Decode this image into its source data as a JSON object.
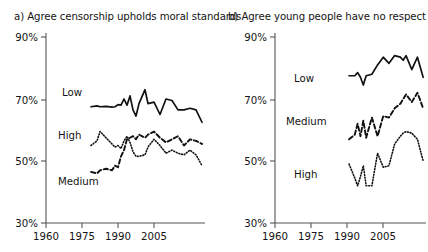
{
  "figure": {
    "background": "#ffffff",
    "ink_color": "#111111",
    "axis_color": "#555555"
  },
  "panels": [
    {
      "key": "panel_a",
      "label": "a)",
      "title": "a) Agree censorship upholds moral standards"
    },
    {
      "key": "panel_b",
      "label": "b)",
      "title": "b) Agree young people have no respect"
    }
  ],
  "chart_data": [
    {
      "type": "line",
      "title": "a) Agree censorship upholds moral standards",
      "xlabel": "",
      "ylabel": "",
      "xlim": [
        1960,
        2013
      ],
      "ylim": [
        30,
        90
      ],
      "xticks": [
        1960,
        1975,
        1990,
        2005
      ],
      "xtick_labels": [
        "1960",
        "1975",
        "1990",
        "2005"
      ],
      "yticks": [
        30,
        50,
        70,
        90
      ],
      "ytick_labels": [
        "30%",
        "50%",
        "70%",
        "90%"
      ],
      "grid": false,
      "legend": "inline-labels",
      "annotations": [
        {
          "text": "Low",
          "x": 1977,
          "y": 71.5
        },
        {
          "text": "High",
          "x": 1976,
          "y": 57.5
        },
        {
          "text": "Medium",
          "x": 1977,
          "y": 44.5
        }
      ],
      "series": [
        {
          "name": "Low",
          "style": "solid",
          "x": [
            1975,
            1977,
            1978,
            1980,
            1982,
            1983,
            1984,
            1985,
            1986,
            1987,
            1988,
            1989,
            1990,
            1991,
            1993,
            1994,
            1996,
            1998,
            2000,
            2002,
            2004,
            2006,
            2008,
            2010,
            2012
          ],
          "values": [
            67.5,
            67.8,
            67.5,
            67.6,
            67.4,
            67.5,
            68.2,
            68.0,
            70.0,
            68.0,
            71.0,
            66.5,
            64.5,
            68.5,
            73.0,
            68.5,
            69.0,
            65.0,
            70.0,
            69.5,
            66.5,
            66.5,
            67.0,
            66.5,
            62.5
          ]
        },
        {
          "name": "Medium",
          "style": "dashed",
          "x": [
            1975,
            1977,
            1978,
            1980,
            1982,
            1983,
            1984,
            1985,
            1986,
            1987,
            1988,
            1989,
            1990,
            1991,
            1993,
            1994,
            1996,
            1998,
            2000,
            2002,
            2004,
            2006,
            2008,
            2010,
            2012
          ],
          "values": [
            46.5,
            46.0,
            47.0,
            47.5,
            47.0,
            48.5,
            48.0,
            51.5,
            53.5,
            57.0,
            57.5,
            58.0,
            57.0,
            58.5,
            57.5,
            58.5,
            59.5,
            57.5,
            56.0,
            57.0,
            58.0,
            55.0,
            57.0,
            56.5,
            55.5
          ]
        },
        {
          "name": "High",
          "style": "dotted",
          "x": [
            1975,
            1977,
            1978,
            1980,
            1982,
            1983,
            1984,
            1985,
            1986,
            1987,
            1988,
            1989,
            1990,
            1991,
            1993,
            1994,
            1996,
            1998,
            2000,
            2002,
            2004,
            2006,
            2008,
            2010,
            2012
          ],
          "values": [
            55.0,
            56.5,
            59.5,
            57.5,
            55.5,
            54.5,
            55.0,
            54.0,
            56.5,
            58.0,
            56.0,
            53.0,
            51.5,
            51.5,
            52.0,
            54.5,
            57.0,
            55.0,
            52.5,
            53.5,
            52.5,
            52.0,
            53.5,
            52.0,
            48.5
          ]
        }
      ]
    },
    {
      "type": "line",
      "title": "b) Agree young people have no respect",
      "xlabel": "",
      "ylabel": "",
      "xlim": [
        1960,
        2013
      ],
      "ylim": [
        30,
        90
      ],
      "xticks": [
        1960,
        1975,
        1990,
        2005
      ],
      "xtick_labels": [
        "1960",
        "1975",
        "1990",
        "2005"
      ],
      "yticks": [
        30,
        50,
        70,
        90
      ],
      "ytick_labels": [
        "30%",
        "50%",
        "70%",
        "90%"
      ],
      "grid": false,
      "legend": "inline-labels",
      "annotations": [
        {
          "text": "Low",
          "x": 1987,
          "y": 77.5
        },
        {
          "text": "Medium",
          "x": 1988,
          "y": 62.0
        },
        {
          "text": "High",
          "x": 1990,
          "y": 44.0
        }
      ],
      "series": [
        {
          "name": "Low",
          "style": "solid",
          "x": [
            1986,
            1988,
            1989,
            1990,
            1991,
            1992,
            1994,
            1996,
            1998,
            2000,
            2002,
            2004,
            2005,
            2006,
            2008,
            2010,
            2012
          ],
          "values": [
            77.5,
            77.5,
            78.5,
            77.0,
            74.5,
            77.5,
            78.0,
            81.0,
            83.5,
            81.5,
            84.0,
            83.5,
            82.5,
            84.0,
            79.5,
            83.5,
            77.0
          ]
        },
        {
          "name": "Medium",
          "style": "dashed",
          "x": [
            1986,
            1988,
            1989,
            1990,
            1991,
            1992,
            1994,
            1996,
            1998,
            2000,
            2002,
            2004,
            2005,
            2006,
            2008,
            2010,
            2012
          ],
          "values": [
            57.0,
            58.5,
            62.0,
            58.0,
            63.0,
            57.5,
            64.0,
            58.0,
            64.5,
            64.0,
            67.0,
            68.5,
            70.0,
            71.5,
            69.0,
            72.0,
            67.0
          ]
        },
        {
          "name": "High",
          "style": "dotted",
          "x": [
            1986,
            1988,
            1989,
            1990,
            1991,
            1992,
            1994,
            1996,
            1998,
            2000,
            2002,
            2004,
            2005,
            2006,
            2008,
            2010,
            2012
          ],
          "values": [
            49.0,
            44.5,
            42.0,
            45.0,
            48.5,
            42.0,
            42.0,
            52.5,
            48.0,
            48.5,
            55.5,
            58.0,
            59.0,
            59.5,
            59.0,
            57.0,
            50.0
          ]
        }
      ]
    }
  ]
}
